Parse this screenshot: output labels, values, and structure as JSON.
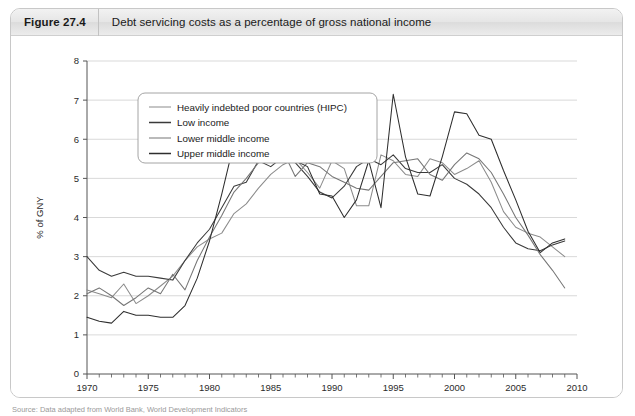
{
  "figure": {
    "number": "Figure 27.4",
    "title": "Debt servicing costs as a percentage of gross national income",
    "source": "Source: Data adapted from World Bank, World Development Indicators"
  },
  "chart_data": {
    "type": "line",
    "title": "Debt servicing costs as a percentage of gross national income",
    "xlabel": "",
    "ylabel": "% of GNY",
    "xlim": [
      1970,
      2010
    ],
    "ylim": [
      0,
      8
    ],
    "grid": true,
    "legend_position": "top-left-inside",
    "x_ticks": [
      1970,
      1975,
      1980,
      1985,
      1990,
      1995,
      2000,
      2005,
      2010
    ],
    "x_tick_labels": [
      "1970",
      "1975",
      "1980",
      "1985",
      "1990",
      "1995",
      "2000",
      "2005",
      "2010"
    ],
    "x_minor_tick_step": 1,
    "y_ticks": [
      0,
      1,
      2,
      3,
      4,
      5,
      6,
      7,
      8
    ],
    "y_tick_labels": [
      "0",
      "1",
      "2",
      "3",
      "4",
      "5",
      "6",
      "7",
      "8"
    ],
    "x": [
      1970,
      1971,
      1972,
      1973,
      1974,
      1975,
      1976,
      1977,
      1978,
      1979,
      1980,
      1981,
      1982,
      1983,
      1984,
      1985,
      1986,
      1987,
      1988,
      1989,
      1990,
      1991,
      1992,
      1993,
      1994,
      1995,
      1996,
      1997,
      1998,
      1999,
      2000,
      2001,
      2002,
      2003,
      2004,
      2005,
      2006,
      2007,
      2008,
      2009
    ],
    "series": [
      {
        "name": "Heavily indebted poor countries (HIPC)",
        "color": "#8c8c8c",
        "values": [
          2.15,
          2.05,
          1.95,
          2.3,
          1.8,
          2.0,
          2.25,
          2.5,
          2.9,
          3.25,
          3.45,
          3.6,
          4.1,
          4.35,
          4.75,
          5.1,
          5.35,
          5.5,
          5.15,
          4.75,
          5.45,
          5.25,
          4.3,
          4.3,
          5.6,
          5.45,
          5.1,
          5.05,
          5.5,
          5.4,
          5.1,
          5.25,
          5.45,
          4.9,
          4.15,
          3.75,
          3.6,
          3.5,
          3.25,
          3.0
        ]
      },
      {
        "name": "Low income",
        "color": "#3a3a3a",
        "values": [
          3.0,
          2.65,
          2.5,
          2.6,
          2.5,
          2.5,
          2.45,
          2.4,
          2.9,
          3.35,
          3.7,
          4.25,
          4.8,
          4.9,
          5.45,
          5.3,
          5.55,
          5.4,
          5.05,
          4.65,
          4.5,
          4.8,
          5.3,
          5.5,
          5.35,
          5.6,
          5.25,
          5.15,
          5.15,
          5.35,
          5.0,
          4.85,
          4.6,
          4.25,
          3.75,
          3.35,
          3.2,
          3.15,
          3.3,
          3.4
        ]
      },
      {
        "name": "Lower middle income",
        "color": "#767676",
        "values": [
          2.05,
          2.2,
          2.0,
          1.75,
          1.95,
          2.2,
          2.05,
          2.55,
          2.15,
          2.9,
          3.5,
          4.05,
          4.65,
          5.0,
          5.4,
          5.95,
          5.7,
          5.05,
          5.4,
          5.3,
          5.05,
          4.9,
          4.75,
          4.7,
          5.05,
          5.4,
          5.45,
          5.5,
          5.1,
          4.95,
          5.35,
          5.65,
          5.5,
          5.15,
          4.6,
          4.0,
          3.55,
          3.05,
          2.65,
          2.2
        ]
      },
      {
        "name": "Upper middle income",
        "color": "#2e2e2e",
        "values": [
          1.45,
          1.35,
          1.3,
          1.6,
          1.5,
          1.5,
          1.45,
          1.45,
          1.75,
          2.45,
          3.4,
          4.6,
          5.9,
          5.6,
          5.9,
          5.45,
          5.65,
          5.45,
          5.3,
          4.6,
          4.55,
          4.0,
          4.45,
          5.45,
          4.25,
          7.15,
          5.55,
          4.6,
          4.55,
          5.55,
          6.7,
          6.65,
          6.1,
          6.0,
          5.2,
          4.45,
          3.65,
          3.1,
          3.35,
          3.45
        ]
      }
    ]
  }
}
